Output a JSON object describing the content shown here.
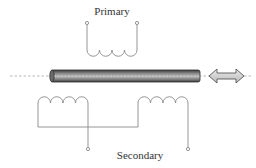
{
  "diagram": {
    "labels": {
      "primary": "Primary",
      "secondary": "Secondary"
    },
    "colors": {
      "wire": "#8a8a8a",
      "rod_dark": "#555555",
      "rod_light": "#b8b8b8",
      "arrow_fill": "#d0d0d0",
      "arrow_stroke": "#555555",
      "axis_dash": "#999999"
    },
    "components": [
      {
        "name": "primary-coil",
        "turns": 4
      },
      {
        "name": "secondary-coil-left",
        "turns": 4
      },
      {
        "name": "secondary-coil-right",
        "turns": 4
      },
      {
        "name": "core-rod"
      },
      {
        "name": "movement-arrow",
        "direction": "bidirectional"
      }
    ]
  }
}
